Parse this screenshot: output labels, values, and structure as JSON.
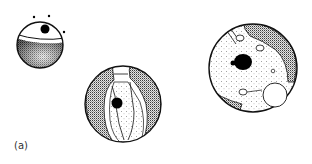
{
  "figure": {
    "panel_label": "(a)",
    "items": [
      {
        "name": "small-sphere",
        "description": "small sphere with dark stippled lower half, black nucleus and dots on top"
      },
      {
        "name": "middle-sphere",
        "description": "sphere with two crescent-shaped stippled regions and a black nucleus"
      },
      {
        "name": "large-sphere",
        "description": "large sphere with stippled cytoplasm, dark stippled crescents, black nucleus and vesicles"
      }
    ],
    "colors": {
      "ink": "#111111",
      "background": "#ffffff"
    }
  }
}
